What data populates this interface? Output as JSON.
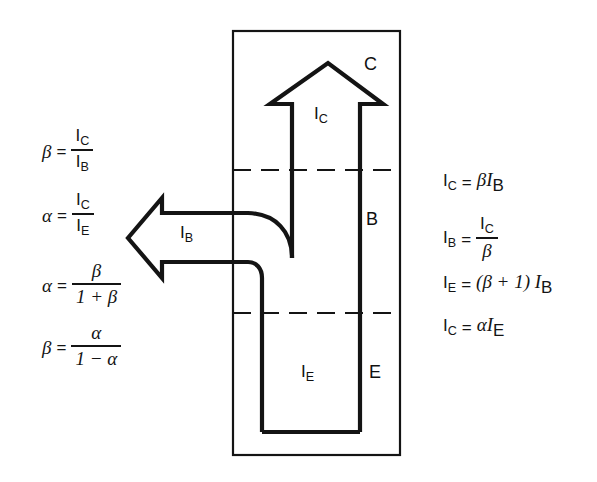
{
  "figure": {
    "colors": {
      "ink": "#141414",
      "background": "#ffffff"
    }
  },
  "diagram": {
    "region_labels": {
      "collector": "C",
      "base": "B",
      "emitter": "E"
    },
    "current_labels": {
      "collector_current": "I",
      "collector_current_sub": "C",
      "base_current": "I",
      "base_current_sub": "B",
      "emitter_current": "I",
      "emitter_current_sub": "E"
    }
  },
  "left_equations": [
    {
      "id": "beta-ic-over-ib",
      "lhs": "β",
      "rel": "=",
      "numerator": "I",
      "numerator_sub": "C",
      "denominator": "I",
      "denominator_sub": "B",
      "text": "β = I_C / I_B"
    },
    {
      "id": "alpha-ic-over-ie",
      "lhs": "α",
      "rel": "=",
      "numerator": "I",
      "numerator_sub": "C",
      "denominator": "I",
      "denominator_sub": "E",
      "text": "α = I_C / I_E"
    },
    {
      "id": "alpha-beta-over-one-plus-beta",
      "lhs": "α",
      "rel": "=",
      "numerator": "β",
      "denominator": "1 + β",
      "text": "α = β / (1 + β)"
    },
    {
      "id": "beta-alpha-over-one-minus-alpha",
      "lhs": "β",
      "rel": "=",
      "numerator": "α",
      "denominator": "1 − α",
      "text": "β = α / (1 − α)"
    }
  ],
  "right_equations": [
    {
      "id": "ic-equals-beta-ib",
      "lhs": "I",
      "lhs_sub": "C",
      "rel": "=",
      "rhs": "βI",
      "rhs_sub": "B",
      "text": "I_C = β I_B"
    },
    {
      "id": "ib-equals-ic-over-beta",
      "lhs": "I",
      "lhs_sub": "B",
      "rel": "=",
      "numerator": "I",
      "numerator_sub": "C",
      "denominator": "β",
      "text": "I_B = I_C / β"
    },
    {
      "id": "ie-equals-beta-plus-one-ib",
      "lhs": "I",
      "lhs_sub": "E",
      "rel": "=",
      "rhs": "(β + 1) I",
      "rhs_sub": "B",
      "text": "I_E = (β + 1) I_B"
    },
    {
      "id": "ic-equals-alpha-ie",
      "lhs": "I",
      "lhs_sub": "C",
      "rel": "=",
      "rhs": "αI",
      "rhs_sub": "E",
      "text": "I_C = α I_E"
    }
  ]
}
